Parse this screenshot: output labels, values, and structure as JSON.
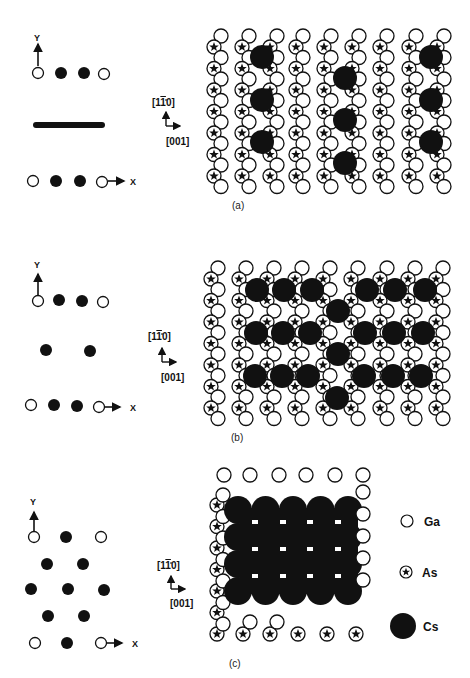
{
  "figure": {
    "panels": [
      {
        "id": "a",
        "caption": "(a)",
        "schematic": {
          "y_axis_label": "Y",
          "x_axis_label": "X",
          "description": "Top row: Ga, Cs, Cs, Ga; middle: long Cs bar (chain); bottom row: Ga, Cs, Cs, Ga"
        },
        "direction_labels": {
          "vertical": "[1̅1̅0]",
          "vertical_display": "[1 1̄ 0]",
          "horizontal": "[001]"
        }
      },
      {
        "id": "b",
        "caption": "(b)",
        "schematic": {
          "y_axis_label": "Y",
          "x_axis_label": "X",
          "description": "Top row: Ga, Cs, Cs, Ga; middle: 2 Cs; bottom row: Ga, Cs, Cs, Ga"
        },
        "direction_labels": {
          "vertical_display": "[1 1̄ 0]",
          "horizontal": "[001]"
        }
      },
      {
        "id": "c",
        "caption": "(c)",
        "schematic": {
          "y_axis_label": "Y",
          "x_axis_label": "X",
          "description": "Hexagonal Cs arrangement between Ga corners"
        },
        "direction_labels": {
          "vertical_display": "[1 1̄ 0]",
          "horizontal": "[001]"
        }
      }
    ],
    "legend": [
      {
        "symbol": "open-circle",
        "label": "Ga"
      },
      {
        "symbol": "star-in-circle",
        "label": "As"
      },
      {
        "symbol": "filled-circle",
        "label": "Cs"
      }
    ],
    "labels": {
      "y": "Y",
      "x": "X",
      "dir_v_a": "[1",
      "dir_v_bar": "1",
      "dir_v_c": "0]",
      "dir_h": "[001]",
      "cap_a": "(a)",
      "cap_b": "(b)",
      "cap_c": "(c)",
      "leg_ga": "Ga",
      "leg_as": "As",
      "leg_cs": "Cs"
    }
  }
}
